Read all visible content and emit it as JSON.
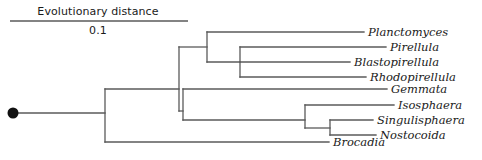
{
  "figure": {
    "kind": "phylogenetic-tree-cladogram",
    "background_color": "#ffffff",
    "line_color": "#5a5a5a",
    "text_color": "#1a1a1a"
  },
  "scale": {
    "title": "Evolutionary distance",
    "value": "0.1",
    "bar_x_start": 10,
    "bar_x_end": 188,
    "bar_y": 21
  },
  "root": {
    "marker": "root-node-dot",
    "x": 13,
    "y": 113,
    "radius": 5.5
  },
  "taxa": [
    {
      "id": "planctomyces",
      "label": "Planctomyces",
      "tip_x": 364,
      "y": 32,
      "label_x": 368
    },
    {
      "id": "pirellula",
      "label": "Pirellula",
      "tip_x": 386,
      "y": 47,
      "label_x": 390
    },
    {
      "id": "blastopirellula",
      "label": "Blastopirellula",
      "tip_x": 350,
      "y": 62,
      "label_x": 354
    },
    {
      "id": "rhodopirellula",
      "label": "Rhodopirellula",
      "tip_x": 366,
      "y": 77,
      "label_x": 370
    },
    {
      "id": "gemmata",
      "label": "Gemmata",
      "tip_x": 387,
      "y": 89,
      "label_x": 391
    },
    {
      "id": "isosphaera",
      "label": "Isosphaera",
      "tip_x": 394,
      "y": 105,
      "label_x": 398
    },
    {
      "id": "singulisphaera",
      "label": "Singulisphaera",
      "tip_x": 373,
      "y": 120,
      "label_x": 377
    },
    {
      "id": "nostocoida",
      "label": "Nostocoida",
      "tip_x": 376,
      "y": 135,
      "label_x": 380
    },
    {
      "id": "brocadia",
      "label": "Brocadia",
      "tip_x": 329,
      "y": 142,
      "label_x": 333
    }
  ],
  "edges": {
    "root_stem": {
      "x1": 13,
      "y1": 113,
      "x2": 105,
      "y2": 113
    },
    "root_vertical": {
      "x": 105,
      "y1": 89,
      "y2": 142
    },
    "brocadia_branch": {
      "x1": 105,
      "y1": 142,
      "x2": 329,
      "y2": 142
    },
    "planctomycetes_stem": {
      "x1": 105,
      "y1": 89,
      "x2": 179,
      "y2": 89
    },
    "node_a_vertical": {
      "x": 179,
      "y1": 47,
      "y2": 111
    },
    "pirellula_clade_stem": {
      "x1": 179,
      "y1": 47,
      "x2": 207,
      "y2": 47
    },
    "node_b_vertical": {
      "x": 207,
      "y1": 32,
      "y2": 62
    },
    "planctomyces_branch": {
      "x1": 207,
      "y1": 32,
      "x2": 364,
      "y2": 32
    },
    "node_c_stem": {
      "x1": 207,
      "y1": 62,
      "x2": 240,
      "y2": 62
    },
    "node_c_vertical": {
      "x": 240,
      "y1": 47,
      "y2": 77
    },
    "pirellula_branch": {
      "x1": 240,
      "y1": 47,
      "x2": 386,
      "y2": 47
    },
    "blastopirellula_branch": {
      "x1": 240,
      "y1": 62,
      "x2": 350,
      "y2": 62
    },
    "rhodopirellula_branch": {
      "x1": 240,
      "y1": 77,
      "x2": 366,
      "y2": 77
    },
    "isosphaera_group_stem": {
      "x1": 179,
      "y1": 111,
      "x2": 183,
      "y2": 111
    },
    "node_d_vertical": {
      "x": 183,
      "y1": 89,
      "y2": 120
    },
    "gemmata_branch": {
      "x1": 183,
      "y1": 89,
      "x2": 387,
      "y2": 89
    },
    "node_e_stem": {
      "x1": 183,
      "y1": 120,
      "x2": 305,
      "y2": 120
    },
    "node_e_vertical": {
      "x": 305,
      "y1": 105,
      "y2": 128
    },
    "isosphaera_branch": {
      "x1": 305,
      "y1": 105,
      "x2": 394,
      "y2": 105
    },
    "node_f_stem": {
      "x1": 305,
      "y1": 128,
      "x2": 330,
      "y2": 128
    },
    "node_f_vertical": {
      "x": 330,
      "y1": 120,
      "y2": 135
    },
    "singulisphaera_branch": {
      "x1": 330,
      "y1": 120,
      "x2": 373,
      "y2": 120
    },
    "nostocoida_branch": {
      "x1": 330,
      "y1": 135,
      "x2": 376,
      "y2": 135
    }
  }
}
